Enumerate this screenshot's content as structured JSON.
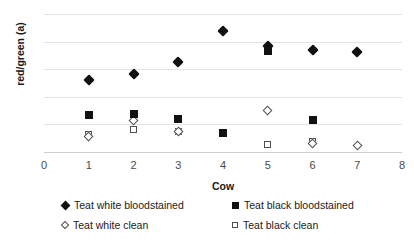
{
  "chart_data": {
    "type": "scatter",
    "title": "",
    "xlabel": "Cow",
    "ylabel": "red/green (a)",
    "xlim": [
      0,
      8
    ],
    "ylim": [
      0,
      20
    ],
    "xticks": [
      0,
      1,
      2,
      3,
      4,
      5,
      6,
      7,
      8
    ],
    "yticks": [
      0,
      4,
      8,
      12,
      16,
      20
    ],
    "grid": "horizontal",
    "legend_position": "bottom",
    "x": [
      1,
      2,
      3,
      4,
      5,
      6,
      7
    ],
    "series": [
      {
        "name": "Teat white bloodstained",
        "marker": "diamond-filled",
        "color": "#111111",
        "x": [
          1,
          2,
          3,
          4,
          5,
          6,
          7
        ],
        "values": [
          10.5,
          11.3,
          13.1,
          17.5,
          15.3,
          14.8,
          14.5
        ]
      },
      {
        "name": "Teat black bloodstained",
        "marker": "square-filled",
        "color": "#111111",
        "x": [
          1,
          2,
          3,
          4,
          5,
          6
        ],
        "values": [
          5.4,
          5.5,
          4.8,
          2.7,
          14.6,
          4.7
        ]
      },
      {
        "name": "Teat white clean",
        "marker": "diamond-open",
        "color": "#4f4f4f",
        "x": [
          1,
          2,
          3,
          5,
          6,
          7
        ],
        "values": [
          2.2,
          4.6,
          2.9,
          6.0,
          1.2,
          0.9
        ]
      },
      {
        "name": "Teat black clean",
        "marker": "square-open",
        "color": "#4f4f4f",
        "x": [
          1,
          2,
          3,
          4,
          5,
          6
        ],
        "values": [
          2.6,
          3.2,
          3.0,
          2.8,
          1.1,
          1.5
        ]
      }
    ]
  },
  "axes": {
    "y_title": "red/green (a)",
    "x_title": "Cow",
    "y_tick_labels": [
      "0",
      "4",
      "8",
      "12",
      "16",
      "20"
    ],
    "x_tick_labels": [
      "0",
      "1",
      "2",
      "3",
      "4",
      "5",
      "6",
      "7",
      "8"
    ]
  },
  "legend": {
    "entries": [
      {
        "label": "Teat white bloodstained",
        "marker": "diamond-filled"
      },
      {
        "label": "Teat black bloodstained",
        "marker": "square-filled"
      },
      {
        "label": "Teat white clean",
        "marker": "diamond-open"
      },
      {
        "label": "Teat black clean",
        "marker": "square-open"
      }
    ]
  }
}
